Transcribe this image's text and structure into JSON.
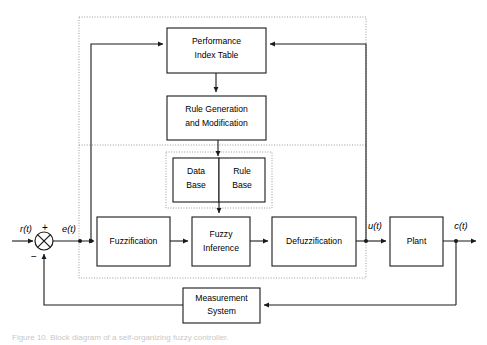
{
  "diagram": {
    "type": "block-diagram",
    "canvas": {
      "width": 487,
      "height": 345
    },
    "blocks": [
      {
        "id": "performance-index-table",
        "label_line1": "Performance",
        "label_line2": "Index Table",
        "x": 167,
        "y": 28,
        "w": 99,
        "h": 45
      },
      {
        "id": "rule-generation",
        "label_line1": "Rule Generation",
        "label_line2": "and Modification",
        "x": 167,
        "y": 96,
        "w": 99,
        "h": 44
      },
      {
        "id": "data-base",
        "label_line1": "Data",
        "label_line2": "Base",
        "x": 173,
        "y": 158,
        "w": 46,
        "h": 44
      },
      {
        "id": "rule-base",
        "label_line1": "Rule",
        "label_line2": "Base",
        "x": 219,
        "y": 158,
        "w": 46,
        "h": 44
      },
      {
        "id": "fuzzification",
        "label_line1": "Fuzzification",
        "label_line2": "",
        "x": 97,
        "y": 217,
        "w": 73,
        "h": 49
      },
      {
        "id": "fuzzy-inference",
        "label_line1": "Fuzzy",
        "label_line2": "Inference",
        "x": 192,
        "y": 217,
        "w": 58,
        "h": 49
      },
      {
        "id": "defuzzification",
        "label_line1": "Defuzzification",
        "label_line2": "",
        "x": 272,
        "y": 217,
        "w": 84,
        "h": 49
      },
      {
        "id": "plant",
        "label_line1": "Plant",
        "label_line2": "",
        "x": 390,
        "y": 217,
        "w": 53,
        "h": 49
      },
      {
        "id": "measurement-system",
        "label_line1": "Measurement",
        "label_line2": "System",
        "x": 183,
        "y": 288,
        "w": 77,
        "h": 35
      }
    ],
    "groups": [
      {
        "id": "outer-controller-boundary",
        "x": 79,
        "y": 17,
        "w": 287,
        "h": 261
      },
      {
        "id": "knowledge-base-boundary",
        "x": 166,
        "y": 152,
        "w": 106,
        "h": 56
      }
    ],
    "dividers": [
      {
        "id": "learning-layer-divider",
        "x1": 79,
        "y1": 145,
        "x2": 366,
        "y2": 145
      }
    ],
    "signals": [
      {
        "id": "reference-input",
        "label": "r(t)",
        "x": 26,
        "y": 230
      },
      {
        "id": "reference-sign",
        "label": "+",
        "x": 44,
        "y": 228
      },
      {
        "id": "feedback-sign",
        "label": "−",
        "x": 35,
        "y": 256
      },
      {
        "id": "error-signal",
        "label": "e(t)",
        "x": 69,
        "y": 230
      },
      {
        "id": "control-signal",
        "label": "u(t)",
        "x": 374,
        "y": 227
      },
      {
        "id": "output-signal",
        "label": "c(t)",
        "x": 461,
        "y": 227
      }
    ],
    "summing_junction": {
      "id": "summing-junction",
      "cx": 44,
      "cy": 241,
      "r": 9
    },
    "nodes": [
      {
        "id": "error-tap",
        "cx": 80,
        "cy": 241
      },
      {
        "id": "error-branch-tap",
        "cx": 91,
        "cy": 241
      },
      {
        "id": "control-tap",
        "cx": 366,
        "cy": 241
      },
      {
        "id": "output-tap",
        "cx": 456,
        "cy": 241
      }
    ],
    "colors": {
      "line": "#1a1a1a",
      "group_border": "#9a9a9a",
      "box_fill": "#ffffff",
      "background": "#ffffff"
    },
    "caption": "Figure 10. Block diagram of a self-organizing fuzzy controller."
  }
}
